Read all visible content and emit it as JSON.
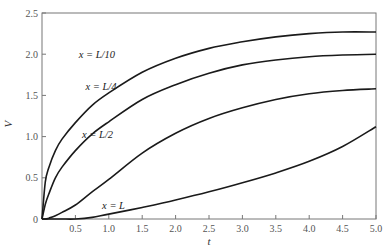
{
  "chart_data": {
    "type": "line",
    "title": "",
    "xlabel": "t",
    "ylabel": "V",
    "xlim": [
      0,
      5.0
    ],
    "ylim": [
      0,
      2.5
    ],
    "grid": false,
    "legend": "inline curve labels",
    "x_ticks": [
      "0.5",
      "1.0",
      "1.5",
      "2.0",
      "2.5",
      "3.0",
      "3.5",
      "4.0",
      "4.5",
      "5.0"
    ],
    "y_ticks": [
      "0",
      "0.5",
      "1.0",
      "1.5",
      "2.0",
      "2.5"
    ],
    "x": [
      0,
      0.05,
      0.1,
      0.2,
      0.3,
      0.5,
      0.75,
      1.0,
      1.5,
      2.0,
      2.5,
      3.0,
      3.5,
      4.0,
      4.5,
      5.0
    ],
    "series": [
      {
        "name": "x = L/10",
        "label_pos": [
          0.55,
          1.95
        ],
        "values": [
          0,
          0.45,
          0.62,
          0.83,
          0.97,
          1.17,
          1.38,
          1.53,
          1.78,
          1.95,
          2.07,
          2.15,
          2.21,
          2.25,
          2.27,
          2.27
        ]
      },
      {
        "name": "x = L/4",
        "label_pos": [
          0.65,
          1.57
        ],
        "values": [
          0,
          0.18,
          0.3,
          0.5,
          0.63,
          0.83,
          1.03,
          1.18,
          1.45,
          1.63,
          1.77,
          1.87,
          1.93,
          1.97,
          1.99,
          2.0
        ]
      },
      {
        "name": "x = L/2",
        "label_pos": [
          0.6,
          0.98
        ],
        "values": [
          0,
          0.0,
          0.01,
          0.04,
          0.08,
          0.17,
          0.33,
          0.48,
          0.8,
          1.04,
          1.22,
          1.35,
          1.45,
          1.52,
          1.56,
          1.58
        ]
      },
      {
        "name": "x = L",
        "label_pos": [
          0.9,
          0.12
        ],
        "values": [
          0,
          0,
          0,
          0,
          0,
          -0.01,
          0.02,
          0.06,
          0.14,
          0.23,
          0.33,
          0.44,
          0.56,
          0.7,
          0.88,
          1.12
        ]
      }
    ]
  }
}
